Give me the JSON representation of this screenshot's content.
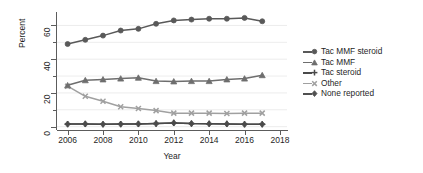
{
  "chart_data": {
    "type": "line",
    "title": "",
    "xlabel": "Year",
    "ylabel": "Percent",
    "xlim": [
      2005.4,
      2018.4
    ],
    "ylim": [
      -2,
      68
    ],
    "xticks": [
      2006,
      2008,
      2010,
      2012,
      2014,
      2016,
      2018
    ],
    "yticks": [
      0,
      20,
      40,
      60
    ],
    "yticks_minor": [
      10,
      30,
      50
    ],
    "grid": "horizontal-faint",
    "legend_position": "right",
    "x": [
      2006,
      2007,
      2008,
      2009,
      2010,
      2011,
      2012,
      2013,
      2014,
      2015,
      2016,
      2017
    ],
    "series": [
      {
        "name": "Tac MMF steroid",
        "marker": "circle",
        "color": "#595959",
        "values": [
          49.0,
          51.5,
          54.0,
          57.0,
          58.0,
          61.0,
          63.0,
          63.5,
          64.0,
          64.0,
          64.5,
          62.5
        ]
      },
      {
        "name": "Tac MMF",
        "marker": "triangle",
        "color": "#6e6e6e",
        "values": [
          24.5,
          27.5,
          28.0,
          28.5,
          29.0,
          27.0,
          26.8,
          27.0,
          27.0,
          28.0,
          28.5,
          30.5
        ]
      },
      {
        "name": "Tac steroid",
        "marker": "plus",
        "color": "#4a4a4a",
        "values": [
          1.5,
          1.6,
          1.4,
          1.5,
          1.6,
          1.8,
          2.2,
          1.8,
          1.7,
          1.6,
          1.4,
          1.4
        ]
      },
      {
        "name": "Other",
        "marker": "x",
        "color": "#a0a0a0",
        "values": [
          24.0,
          18.0,
          15.0,
          11.8,
          10.8,
          9.5,
          8.0,
          8.0,
          8.0,
          7.8,
          8.0,
          8.0
        ]
      },
      {
        "name": "None reported",
        "marker": "diamond",
        "color": "#505050",
        "values": [
          1.5,
          1.6,
          1.4,
          1.5,
          1.6,
          1.8,
          2.2,
          1.8,
          1.7,
          1.6,
          1.4,
          1.4
        ]
      }
    ]
  },
  "axes": {
    "y_title": "Percent",
    "x_title": "Year",
    "y_tick_labels": [
      "0",
      "20",
      "40",
      "60"
    ],
    "x_tick_labels": [
      "2006",
      "2008",
      "2010",
      "2012",
      "2014",
      "2016",
      "2018"
    ]
  },
  "legend": {
    "items": [
      {
        "label": "Tac MMF steroid",
        "marker": "circle-marker"
      },
      {
        "label": "Tac MMF",
        "marker": "triangle-marker"
      },
      {
        "label": "Tac steroid",
        "marker": "plus-marker"
      },
      {
        "label": "Other",
        "marker": "x-marker"
      },
      {
        "label": "None reported",
        "marker": "diamond-marker"
      }
    ]
  }
}
